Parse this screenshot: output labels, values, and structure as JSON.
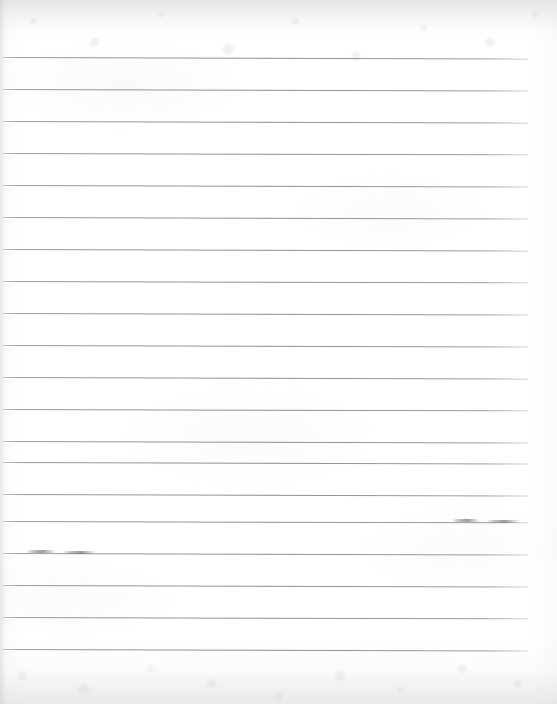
{
  "document": {
    "kind": "scanned-lined-paper",
    "title": "Blank ruled notebook page",
    "visible_text": "",
    "page_width": 557,
    "page_height": 704,
    "background_color": "#ffffff",
    "rule_color": "#84848a",
    "smudge_color": "#606066"
  },
  "ruling": {
    "line_count": 19,
    "first_line_y": 57,
    "line_spacing": 32,
    "line_start_x": 3,
    "line_end_x": 528,
    "line_thickness": 1,
    "lines": [
      {
        "y": 57,
        "x1": 3,
        "x2": 528,
        "tilt": 0.18
      },
      {
        "y": 89,
        "x1": 3,
        "x2": 528,
        "tilt": 0.16
      },
      {
        "y": 121,
        "x1": 3,
        "x2": 528,
        "tilt": 0.18
      },
      {
        "y": 153,
        "x1": 3,
        "x2": 528,
        "tilt": 0.15
      },
      {
        "y": 185,
        "x1": 3,
        "x2": 528,
        "tilt": 0.17
      },
      {
        "y": 217,
        "x1": 3,
        "x2": 528,
        "tilt": 0.16
      },
      {
        "y": 249,
        "x1": 3,
        "x2": 528,
        "tilt": 0.18
      },
      {
        "y": 281,
        "x1": 3,
        "x2": 528,
        "tilt": 0.15
      },
      {
        "y": 313,
        "x1": 3,
        "x2": 528,
        "tilt": 0.17
      },
      {
        "y": 345,
        "x1": 3,
        "x2": 528,
        "tilt": 0.16
      },
      {
        "y": 377,
        "x1": 3,
        "x2": 528,
        "tilt": 0.18
      },
      {
        "y": 409,
        "x1": 3,
        "x2": 528,
        "tilt": 0.15
      },
      {
        "y": 441,
        "x1": 3,
        "x2": 528,
        "tilt": 0.17
      },
      {
        "y": 462,
        "x1": 3,
        "x2": 528,
        "tilt": 0.16
      },
      {
        "y": 494,
        "x1": 3,
        "x2": 528,
        "tilt": 0.17
      },
      {
        "y": 521,
        "x1": 3,
        "x2": 528,
        "tilt": 0.15
      },
      {
        "y": 553,
        "x1": 3,
        "x2": 528,
        "tilt": 0.16
      },
      {
        "y": 585,
        "x1": 3,
        "x2": 528,
        "tilt": 0.17
      },
      {
        "y": 617,
        "x1": 3,
        "x2": 528,
        "tilt": 0.15
      },
      {
        "y": 649,
        "x1": 3,
        "x2": 528,
        "tilt": 0.16
      }
    ]
  },
  "marks": {
    "description": "Faint pencil smudges overlapping two of the ruled lines",
    "items": [
      {
        "name": "pencil-smudge-right-a",
        "x": 452,
        "y": 519,
        "width": 28,
        "height": 3
      },
      {
        "name": "pencil-smudge-right-b",
        "x": 486,
        "y": 520,
        "width": 34,
        "height": 3
      },
      {
        "name": "pencil-smudge-left-a",
        "x": 26,
        "y": 550,
        "width": 30,
        "height": 3
      },
      {
        "name": "pencil-smudge-left-b",
        "x": 62,
        "y": 551,
        "width": 34,
        "height": 3
      }
    ]
  }
}
